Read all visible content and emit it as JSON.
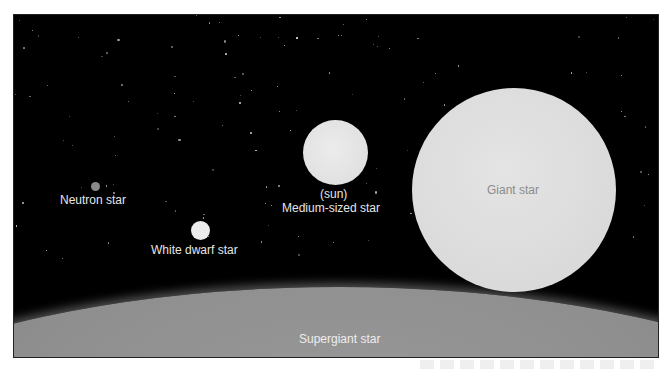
{
  "figure": {
    "background_color": "#000000",
    "stars": [
      {
        "name": "Neutron star",
        "label": "Neutron star",
        "cx": 94,
        "cy": 186,
        "r": 4.5,
        "color": "#8a8a8a"
      },
      {
        "name": "White dwarf star",
        "label": "White dwarf star",
        "cx": 200,
        "cy": 230,
        "r": 9.5,
        "color": "#ececec"
      },
      {
        "name": "Medium-sized star",
        "sublabel": "(sun)",
        "label": "Medium-sized star",
        "cx": 334,
        "cy": 151,
        "r": 32.5,
        "color": "#e2e2e2"
      },
      {
        "name": "Giant star",
        "label": "Giant star",
        "cx": 513,
        "cy": 189,
        "r": 102,
        "color": "#dcdcdc"
      },
      {
        "name": "Supergiant star",
        "label": "Supergiant star",
        "color": "#8e8e8e"
      }
    ]
  }
}
